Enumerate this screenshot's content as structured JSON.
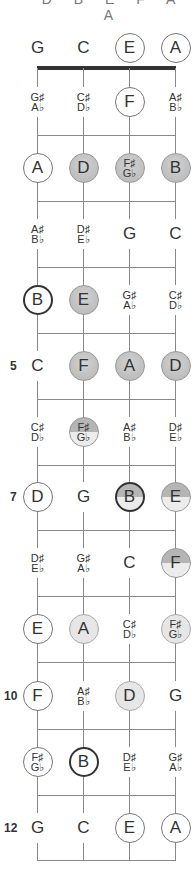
{
  "header_cutoff": "D B E F A A",
  "strings": [
    "G",
    "C",
    "E",
    "A"
  ],
  "string_x": [
    37,
    83,
    129,
    175
  ],
  "nut_y": 68,
  "row_y": [
    48,
    102,
    168,
    234,
    300,
    366,
    432,
    497,
    563,
    629,
    696,
    762,
    828
  ],
  "fret_line_y": [
    135,
    201,
    267,
    333,
    399,
    465,
    530,
    596,
    662,
    729,
    795,
    860
  ],
  "fret_numbers": [
    {
      "fret": 5,
      "label": "5"
    },
    {
      "fret": 7,
      "label": "7"
    },
    {
      "fret": 10,
      "label": "10"
    },
    {
      "fret": 12,
      "label": "12"
    }
  ],
  "colors": {
    "line": "#888888",
    "nut": "#333333",
    "shade": "#b5b5b5",
    "light": "#e6e6e6"
  },
  "rows": [
    [
      {
        "t": "G",
        "s": "plain"
      },
      {
        "t": "C",
        "s": "plain"
      },
      {
        "t": "E",
        "s": "circle"
      },
      {
        "t": "A",
        "s": "circle"
      }
    ],
    [
      {
        "t": "G♯|A♭",
        "s": "plain"
      },
      {
        "t": "C♯|D♭",
        "s": "plain"
      },
      {
        "t": "F",
        "s": "circle"
      },
      {
        "t": "A♯|B♭",
        "s": "plain"
      }
    ],
    [
      {
        "t": "A",
        "s": "circle"
      },
      {
        "t": "D",
        "s": "shade"
      },
      {
        "t": "F♯|G♭",
        "s": "shade"
      },
      {
        "t": "B",
        "s": "shade bold"
      }
    ],
    [
      {
        "t": "A♯|B♭",
        "s": "plain"
      },
      {
        "t": "D♯|E♭",
        "s": "plain"
      },
      {
        "t": "G",
        "s": "plain"
      },
      {
        "t": "C",
        "s": "plain"
      }
    ],
    [
      {
        "t": "B",
        "s": "circle bold"
      },
      {
        "t": "E",
        "s": "shade"
      },
      {
        "t": "G♯|A♭",
        "s": "plain"
      },
      {
        "t": "C♯|D♭",
        "s": "plain"
      }
    ],
    [
      {
        "t": "C",
        "s": "plain"
      },
      {
        "t": "F",
        "s": "shade"
      },
      {
        "t": "A",
        "s": "shade"
      },
      {
        "t": "D",
        "s": "shade"
      }
    ],
    [
      {
        "t": "C♯|D♭",
        "s": "plain"
      },
      {
        "t": "F♯|G♭",
        "s": "half"
      },
      {
        "t": "A♯|B♭",
        "s": "plain"
      },
      {
        "t": "D♯|E♭",
        "s": "plain"
      }
    ],
    [
      {
        "t": "D",
        "s": "circle"
      },
      {
        "t": "G",
        "s": "plain"
      },
      {
        "t": "B",
        "s": "half bold"
      },
      {
        "t": "E",
        "s": "half"
      }
    ],
    [
      {
        "t": "D♯|E♭",
        "s": "plain"
      },
      {
        "t": "G♯|A♭",
        "s": "plain"
      },
      {
        "t": "C",
        "s": "plain"
      },
      {
        "t": "F",
        "s": "half"
      }
    ],
    [
      {
        "t": "E",
        "s": "circle"
      },
      {
        "t": "A",
        "s": "light"
      },
      {
        "t": "C♯|D♭",
        "s": "plain"
      },
      {
        "t": "F♯|G♭",
        "s": "light"
      }
    ],
    [
      {
        "t": "F",
        "s": "circle"
      },
      {
        "t": "A♯|B♭",
        "s": "plain"
      },
      {
        "t": "D",
        "s": "light"
      },
      {
        "t": "G",
        "s": "plain"
      }
    ],
    [
      {
        "t": "F♯|G♭",
        "s": "circle"
      },
      {
        "t": "B",
        "s": "circle bold"
      },
      {
        "t": "D♯|E♭",
        "s": "plain"
      },
      {
        "t": "G♯|A♭",
        "s": "plain"
      }
    ],
    [
      {
        "t": "G",
        "s": "plain"
      },
      {
        "t": "C",
        "s": "plain"
      },
      {
        "t": "E",
        "s": "circle"
      },
      {
        "t": "A",
        "s": "circle"
      }
    ]
  ]
}
